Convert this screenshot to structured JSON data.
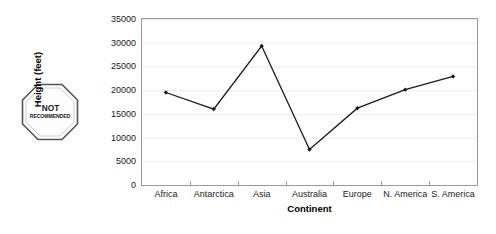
{
  "stamp": {
    "icon": "octagon-stop-icon",
    "line1": "NOT",
    "line2": "RECOMMENDED"
  },
  "chart_data": {
    "type": "line",
    "title": "",
    "subtitle": "",
    "xlabel": "Continent",
    "ylabel": "Height (feet)",
    "categories": [
      "Africa",
      "Antarctica",
      "Asia",
      "Australia",
      "Europe",
      "N. America",
      "S. America"
    ],
    "values": [
      19500,
      16000,
      29300,
      7500,
      16200,
      20100,
      22900
    ],
    "series": [
      {
        "name": "Height (feet)",
        "values": [
          19500,
          16000,
          29300,
          7500,
          16200,
          20100,
          22900
        ]
      }
    ],
    "ylim": [
      0,
      35000
    ],
    "ytick_values": [
      0,
      5000,
      10000,
      15000,
      20000,
      25000,
      30000,
      35000
    ],
    "ytick_labels": [
      "0",
      "5000",
      "10000",
      "15000",
      "20000",
      "25000",
      "30000",
      "35000"
    ],
    "grid": true,
    "grid_axis": "y",
    "legend": false,
    "legend_position": "none",
    "marker": "diamond",
    "line_color": "#1a1a1a",
    "marker_color": "#1a1a1a",
    "grid_color": "#ededed",
    "axis_color": "#9a9a9a",
    "plot_background": "#ffffff"
  }
}
